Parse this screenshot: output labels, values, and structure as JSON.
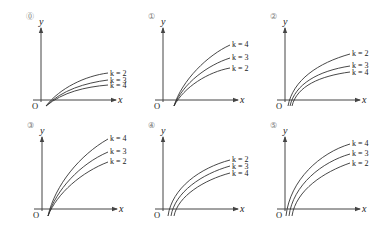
{
  "figure": {
    "panels": [
      {
        "id": "0",
        "marker": "⓪",
        "ox": 41,
        "oy": 100,
        "curves": [
          {
            "label": "k = 2",
            "d": "M46,106 C60,88 85,76 108,73",
            "ly": 76
          },
          {
            "label": "k = 3",
            "d": "M46,106 C62,90 85,83 108,80",
            "ly": 83
          },
          {
            "label": "k = 4",
            "d": "M46,106 C63,92 85,87 108,85",
            "ly": 88
          }
        ]
      },
      {
        "id": "1",
        "marker": "①",
        "ox": 163,
        "oy": 100,
        "curves": [
          {
            "label": "k = 4",
            "d": "M174,106 C182,80 208,55 230,45",
            "ly": 47
          },
          {
            "label": "k = 3",
            "d": "M174,106 C183,83 208,65 230,58",
            "ly": 60
          },
          {
            "label": "k = 2",
            "d": "M174,106 C184,87 208,72 230,68",
            "ly": 71
          }
        ]
      },
      {
        "id": "2",
        "marker": "②",
        "ox": 285,
        "oy": 100,
        "curves": [
          {
            "label": "k = 2",
            "d": "M288,106 C293,80 318,63 350,54",
            "ly": 56
          },
          {
            "label": "k = 3",
            "d": "M290,106 C295,84 318,71 350,66",
            "ly": 68
          },
          {
            "label": "k = 4",
            "d": "M292,106 C297,86 320,76 350,72",
            "ly": 75
          }
        ]
      },
      {
        "id": "3",
        "marker": "③",
        "ox": 42,
        "oy": 209,
        "curves": [
          {
            "label": "k = 4",
            "d": "M48,216 C55,185 80,155 108,139",
            "ly": 141
          },
          {
            "label": "k = 3",
            "d": "M48,216 C56,190 80,164 108,152",
            "ly": 154
          },
          {
            "label": "k = 2",
            "d": "M48,216 C57,193 82,172 108,162",
            "ly": 164
          }
        ]
      },
      {
        "id": "4",
        "marker": "④",
        "ox": 163,
        "oy": 209,
        "curves": [
          {
            "label": "k = 2",
            "d": "M168,216 C172,188 200,168 230,160",
            "ly": 162
          },
          {
            "label": "k = 3",
            "d": "M171,216 C175,192 202,174 230,166",
            "ly": 169
          },
          {
            "label": "k = 4",
            "d": "M174,216 C178,196 204,180 230,173",
            "ly": 176
          }
        ]
      },
      {
        "id": "5",
        "marker": "⑤",
        "ox": 285,
        "oy": 209,
        "curves": [
          {
            "label": "k = 4",
            "d": "M286,216 C290,180 320,153 350,144",
            "ly": 146
          },
          {
            "label": "k = 3",
            "d": "M289,216 C293,185 322,162 350,154",
            "ly": 156
          },
          {
            "label": "k = 2",
            "d": "M292,216 C296,190 324,172 350,163",
            "ly": 166
          }
        ]
      }
    ],
    "axis_labels": {
      "x": "x",
      "y": "y",
      "origin": "O"
    }
  }
}
